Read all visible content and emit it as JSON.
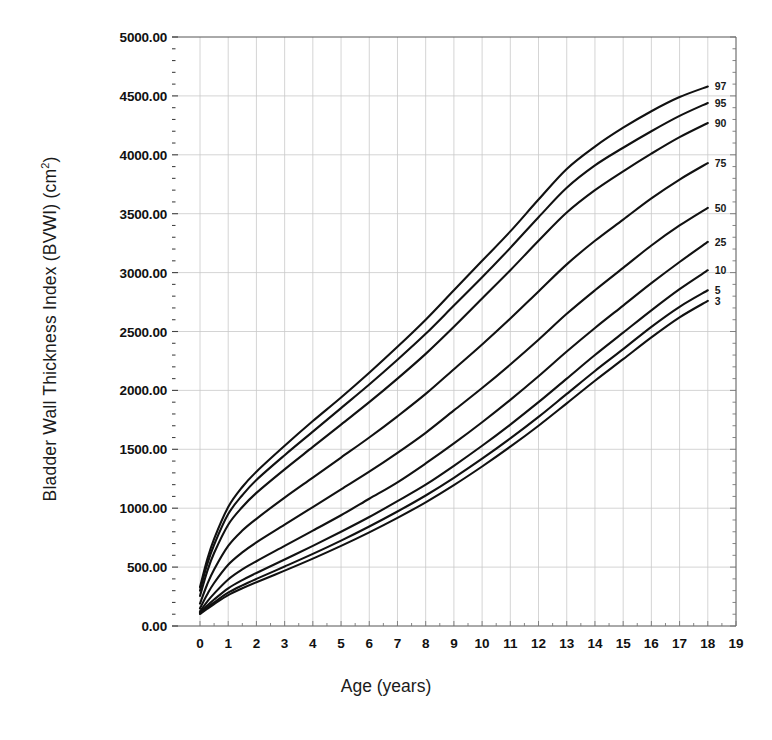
{
  "chart_data": {
    "type": "line",
    "title": "",
    "xlabel": "Age (years)",
    "ylabel": "Bladder Wall Thickness Index (BVWI)  (cm2)",
    "ylabel_main": "Bladder Wall Thickness Index (BVWI)  (cm",
    "ylabel_sup": "2",
    "ylabel_tail": ")",
    "xlim": [
      0,
      19
    ],
    "ylim": [
      0,
      5000
    ],
    "grid": true,
    "legend": "inline-right-end-labels",
    "xticklabels": [
      "0",
      "1",
      "2",
      "3",
      "4",
      "5",
      "6",
      "7",
      "8",
      "9",
      "10",
      "11",
      "12",
      "13",
      "14",
      "15",
      "16",
      "17",
      "18",
      "19"
    ],
    "yticklabels": [
      "0.00",
      "500.00",
      "1000.00",
      "1500.00",
      "2000.00",
      "2500.00",
      "3000.00",
      "3500.00",
      "4000.00",
      "4500.00",
      "5000.00"
    ],
    "ytickvalues": [
      0,
      500,
      1000,
      1500,
      2000,
      2500,
      3000,
      3500,
      4000,
      4500,
      5000
    ],
    "x": [
      0,
      0.25,
      0.5,
      1,
      1.5,
      2,
      3,
      4,
      5,
      6,
      7,
      8,
      9,
      10,
      11,
      12,
      13,
      14,
      15,
      16,
      17,
      18
    ],
    "series": [
      {
        "name": "97",
        "label": "97",
        "values": [
          330,
          560,
          740,
          1010,
          1180,
          1310,
          1530,
          1740,
          1940,
          2150,
          2370,
          2600,
          2850,
          3100,
          3350,
          3620,
          3880,
          4070,
          4230,
          4370,
          4490,
          4580
        ]
      },
      {
        "name": "95",
        "label": "95",
        "values": [
          300,
          520,
          690,
          950,
          1110,
          1240,
          1450,
          1650,
          1850,
          2050,
          2260,
          2480,
          2720,
          2960,
          3210,
          3470,
          3720,
          3910,
          4060,
          4200,
          4330,
          4440
        ]
      },
      {
        "name": "90",
        "label": "90",
        "values": [
          255,
          460,
          620,
          860,
          1010,
          1130,
          1330,
          1520,
          1710,
          1900,
          2100,
          2310,
          2540,
          2780,
          3020,
          3270,
          3510,
          3700,
          3860,
          4010,
          4150,
          4270
        ]
      },
      {
        "name": "75",
        "label": "75",
        "values": [
          190,
          350,
          480,
          680,
          810,
          910,
          1090,
          1260,
          1430,
          1600,
          1780,
          1970,
          2180,
          2390,
          2610,
          2840,
          3070,
          3270,
          3450,
          3630,
          3790,
          3930
        ]
      },
      {
        "name": "50",
        "label": "50",
        "values": [
          150,
          265,
          365,
          520,
          625,
          710,
          860,
          1010,
          1160,
          1310,
          1470,
          1640,
          1830,
          2020,
          2220,
          2430,
          2650,
          2850,
          3040,
          3230,
          3400,
          3550
        ]
      },
      {
        "name": "25",
        "label": "25",
        "values": [
          125,
          205,
          275,
          395,
          480,
          550,
          680,
          810,
          940,
          1080,
          1220,
          1380,
          1550,
          1730,
          1920,
          2120,
          2330,
          2530,
          2720,
          2910,
          3090,
          3260
        ]
      },
      {
        "name": "10",
        "label": "10",
        "values": [
          112,
          172,
          225,
          320,
          390,
          450,
          565,
          680,
          800,
          925,
          1060,
          1200,
          1360,
          1530,
          1710,
          1900,
          2100,
          2300,
          2490,
          2680,
          2860,
          3020
        ]
      },
      {
        "name": "5",
        "label": "5",
        "values": [
          106,
          155,
          200,
          283,
          345,
          400,
          505,
          612,
          725,
          845,
          972,
          1108,
          1258,
          1420,
          1592,
          1775,
          1970,
          2165,
          2350,
          2540,
          2710,
          2850
        ]
      },
      {
        "name": "3",
        "label": "3",
        "values": [
          102,
          145,
          186,
          262,
          320,
          372,
          470,
          572,
          680,
          795,
          918,
          1050,
          1196,
          1354,
          1522,
          1700,
          1890,
          2082,
          2265,
          2450,
          2620,
          2760
        ]
      }
    ]
  },
  "axis": {
    "x_title": "Age (years)",
    "y_title_main": "Bladder Wall Thickness Index (BVWI)  (cm",
    "y_title_sup": "2",
    "y_title_tail": ")"
  }
}
